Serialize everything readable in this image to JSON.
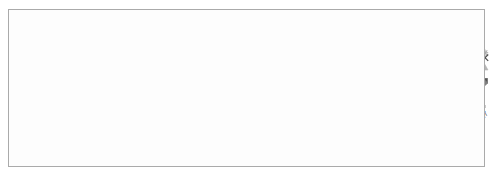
{
  "chart_data": {
    "type": "line",
    "title": "",
    "xlabel": "",
    "ylabel": "",
    "ylim": [
      0,
      80
    ],
    "yticks": [
      0,
      20,
      40,
      60,
      80
    ],
    "grid": true,
    "legend_position": "bottom",
    "categories": [
      "1991",
      "1992",
      "1993",
      "1994",
      "1995",
      "1996",
      "1997",
      "1998",
      "1999",
      "2000",
      "2001",
      "2002",
      "2003",
      "2004",
      "2005",
      "2006",
      "2007",
      "2008",
      "2009",
      "2010",
      "2011",
      "2012",
      "2013",
      "2014",
      "2015",
      "2016",
      "2017"
    ],
    "series": [
      {
        "name": "Spain",
        "marker": "diamond",
        "color": "#808080",
        "values": [
          16.5,
          18.5,
          22.5,
          24.0,
          23.0,
          22.5,
          22.0,
          20.5,
          19.0,
          17.5,
          13.0,
          14.0,
          14.5,
          15.0,
          11.5,
          9.5,
          10.5,
          12.0,
          18.5,
          19.5,
          21.0,
          23.5,
          26.0,
          25.5,
          24.5,
          22.0,
          20.0
        ]
      },
      {
        "name": "United States",
        "marker": "square",
        "color": "#555555",
        "values": [
          23.0,
          25.0,
          29.0,
          30.5,
          29.0,
          28.5,
          26.5,
          23.5,
          21.0,
          19.0,
          16.0,
          17.0,
          17.0,
          16.5,
          14.0,
          12.5,
          13.0,
          16.5,
          26.5,
          29.0,
          29.5,
          32.5,
          32.5,
          30.0,
          26.0,
          23.5,
          22.0
        ]
      },
      {
        "name": "Italy",
        "marker": "triangle",
        "color": "#b5b5b5",
        "values": [
          33.0,
          35.5,
          37.5,
          40.0,
          39.5,
          39.5,
          37.5,
          34.5,
          31.5,
          28.0,
          26.0,
          25.5,
          25.5,
          24.0,
          21.0,
          19.5,
          18.0,
          22.5,
          34.5,
          37.0,
          38.5,
          42.5,
          44.0,
          42.0,
          38.5,
          35.5,
          34.0
        ]
      },
      {
        "name": "Portugal",
        "marker": "x",
        "color": "#4a4a4a",
        "values": [
          37.5,
          39.5,
          45.0,
          48.5,
          47.0,
          46.5,
          43.5,
          39.0,
          34.5,
          31.5,
          28.0,
          29.0,
          32.0,
          30.5,
          28.5,
          26.5,
          26.5,
          31.5,
          44.5,
          47.5,
          51.5,
          57.0,
          61.0,
          56.0,
          50.5,
          46.5,
          43.0
        ]
      },
      {
        "name": "Germany",
        "marker": "asterisk",
        "color": "#aaaaaa",
        "values": [
          42.5,
          45.0,
          51.5,
          56.5,
          56.0,
          56.0,
          54.0,
          50.5,
          46.5,
          43.5,
          36.0,
          40.5,
          41.5,
          41.0,
          40.0,
          37.0,
          35.5,
          38.5,
          51.5,
          55.5,
          58.5,
          64.5,
          65.5,
          60.5,
          55.0,
          50.5,
          47.5
        ]
      }
    ]
  }
}
